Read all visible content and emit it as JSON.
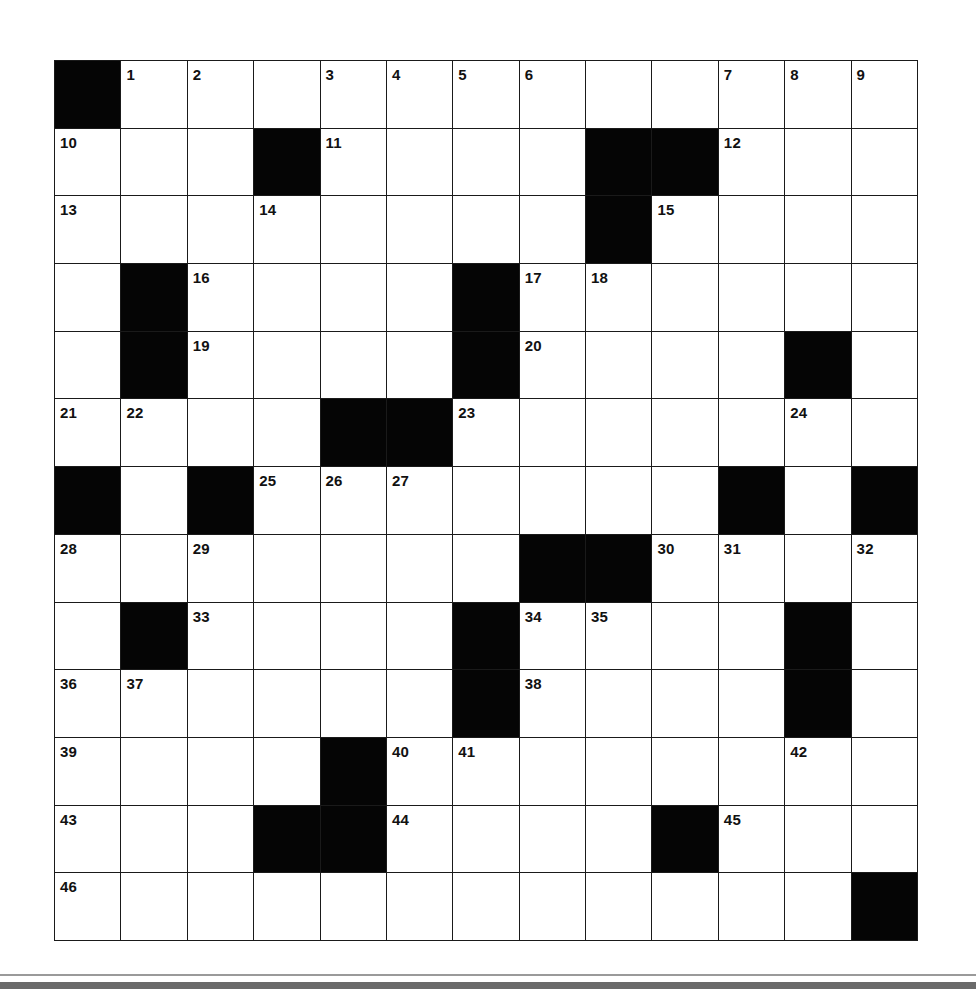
{
  "puzzle": {
    "rows": 13,
    "cols": 13,
    "colors": {
      "block": "#050505",
      "cell": "#ffffff",
      "grid_line": "#1a1a1a",
      "number": "#111111"
    },
    "layout": [
      "#............",
      "...#....##...",
      "........#....",
      ".#....#......",
      ".#....#....#.",
      "....##.......",
      "#.#.......#.#",
      ".......##....",
      ".#....#....#.",
      "......#....#.",
      "....#........",
      "...##....#...",
      "............#"
    ],
    "numbers": [
      [
        0,
        1,
        1
      ],
      [
        0,
        2,
        2
      ],
      [
        0,
        4,
        3
      ],
      [
        0,
        5,
        4
      ],
      [
        0,
        6,
        5
      ],
      [
        0,
        7,
        6
      ],
      [
        0,
        10,
        7
      ],
      [
        0,
        11,
        8
      ],
      [
        0,
        12,
        9
      ],
      [
        1,
        0,
        10
      ],
      [
        1,
        4,
        11
      ],
      [
        1,
        10,
        12
      ],
      [
        2,
        0,
        13
      ],
      [
        2,
        3,
        14
      ],
      [
        2,
        9,
        15
      ],
      [
        3,
        2,
        16
      ],
      [
        3,
        7,
        17
      ],
      [
        3,
        8,
        18
      ],
      [
        4,
        2,
        19
      ],
      [
        4,
        7,
        20
      ],
      [
        5,
        0,
        21
      ],
      [
        5,
        1,
        22
      ],
      [
        5,
        6,
        23
      ],
      [
        5,
        11,
        24
      ],
      [
        6,
        3,
        25
      ],
      [
        6,
        4,
        26
      ],
      [
        6,
        5,
        27
      ],
      [
        7,
        0,
        28
      ],
      [
        7,
        2,
        29
      ],
      [
        7,
        9,
        30
      ],
      [
        7,
        10,
        31
      ],
      [
        7,
        12,
        32
      ],
      [
        8,
        2,
        33
      ],
      [
        8,
        7,
        34
      ],
      [
        8,
        8,
        35
      ],
      [
        9,
        0,
        36
      ],
      [
        9,
        1,
        37
      ],
      [
        9,
        7,
        38
      ],
      [
        10,
        0,
        39
      ],
      [
        10,
        5,
        40
      ],
      [
        10,
        6,
        41
      ],
      [
        10,
        11,
        42
      ],
      [
        11,
        0,
        43
      ],
      [
        11,
        5,
        44
      ],
      [
        11,
        10,
        45
      ],
      [
        12,
        0,
        46
      ]
    ],
    "entries": []
  }
}
